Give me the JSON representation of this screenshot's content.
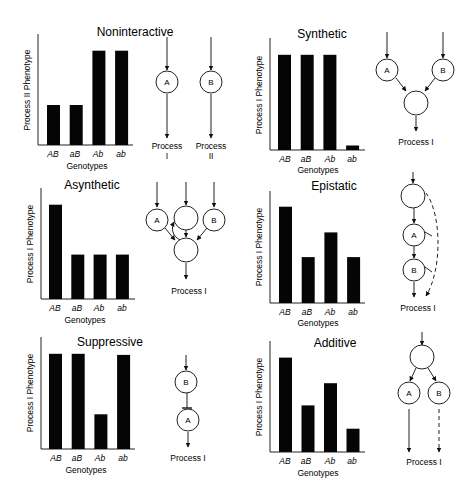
{
  "figure": {
    "panels": [
      {
        "title": "Noninteractive",
        "ylabel": "Process II  Phenotype",
        "xlabel": "Genotypes"
      },
      {
        "title": "Synthetic",
        "ylabel": "Process I  Phenotype",
        "xlabel": "Genotypes"
      },
      {
        "title": "Asynthetic",
        "ylabel": "Process I  Phenotype",
        "xlabel": "Genotypes"
      },
      {
        "title": "Epistatic",
        "ylabel": "Process I  Phenotype",
        "xlabel": "Genotypes"
      },
      {
        "title": "Suppressive",
        "ylabel": "Process I  Phenotype",
        "xlabel": "Genotypes"
      },
      {
        "title": "Additive",
        "ylabel": "Process I  Phenotype",
        "xlabel": "Genotypes"
      }
    ],
    "genotypes": [
      "AB",
      "aB",
      "Ab",
      "ab"
    ],
    "diagram_labels": {
      "node_a": "A",
      "node_b": "B",
      "process": "Process",
      "process_i": "Process I",
      "roman_i": "I",
      "roman_ii": "II"
    }
  },
  "chart_data": [
    {
      "type": "bar",
      "title": "Noninteractive",
      "xlabel": "Genotypes",
      "ylabel": "Process II Phenotype",
      "categories": [
        "AB",
        "aB",
        "Ab",
        "ab"
      ],
      "values": [
        36,
        36,
        85,
        85
      ],
      "ylim": [
        0,
        100
      ],
      "grid": false
    },
    {
      "type": "bar",
      "title": "Synthetic",
      "xlabel": "Genotypes",
      "ylabel": "Process I Phenotype",
      "categories": [
        "AB",
        "aB",
        "Ab",
        "ab"
      ],
      "values": [
        85,
        85,
        85,
        4
      ],
      "ylim": [
        0,
        100
      ],
      "grid": false
    },
    {
      "type": "bar",
      "title": "Asynthetic",
      "xlabel": "Genotypes",
      "ylabel": "Process I Phenotype",
      "categories": [
        "AB",
        "aB",
        "Ab",
        "ab"
      ],
      "values": [
        85,
        40,
        40,
        40
      ],
      "ylim": [
        0,
        100
      ],
      "grid": false
    },
    {
      "type": "bar",
      "title": "Epistatic",
      "xlabel": "Genotypes",
      "ylabel": "Process I Phenotype",
      "categories": [
        "AB",
        "aB",
        "Ab",
        "ab"
      ],
      "values": [
        86,
        41,
        63,
        41
      ],
      "ylim": [
        0,
        100
      ],
      "grid": false
    },
    {
      "type": "bar",
      "title": "Suppressive",
      "xlabel": "Genotypes",
      "ylabel": "Process I Phenotype",
      "categories": [
        "AB",
        "aB",
        "Ab",
        "ab"
      ],
      "values": [
        85,
        85,
        31,
        84
      ],
      "ylim": [
        0,
        100
      ],
      "grid": false
    },
    {
      "type": "bar",
      "title": "Additive",
      "xlabel": "Genotypes",
      "ylabel": "Process I Phenotype",
      "categories": [
        "AB",
        "aB",
        "Ab",
        "ab"
      ],
      "values": [
        85,
        42,
        62,
        21
      ],
      "ylim": [
        0,
        100
      ],
      "grid": false
    }
  ]
}
